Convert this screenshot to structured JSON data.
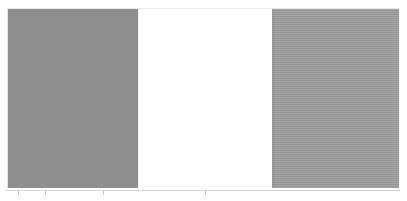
{
  "panel": {
    "name": "tri-band-color-panel",
    "background_color": "#ffffff",
    "bands": [
      {
        "id": "left",
        "label": "",
        "fill": "#8e8e8e",
        "pattern": "solid",
        "x": 7,
        "width": 130
      },
      {
        "id": "center",
        "label": "",
        "fill": "#ffffff",
        "pattern": "solid",
        "x": 137,
        "width": 135
      },
      {
        "id": "right",
        "label": "",
        "fill": "#9b9b9b",
        "pattern": "horizontal-scanlines",
        "x": 272,
        "width": 127
      }
    ]
  },
  "axis": {
    "rule_color": "#d6d6d6",
    "ticks": [
      {
        "x": 12,
        "label": ""
      },
      {
        "x": 39,
        "label": ""
      },
      {
        "x": 97,
        "label": ""
      },
      {
        "x": 199,
        "label": ""
      }
    ]
  },
  "chart_data": {
    "type": "bar",
    "title": "",
    "xlabel": "",
    "ylabel": "",
    "categories": [
      "1",
      "2",
      "3"
    ],
    "values": [
      1,
      1,
      1
    ],
    "colors": [
      "#8e8e8e",
      "#ffffff",
      "#9b9b9b"
    ],
    "grid": false,
    "legend": "none",
    "xlim": [
      0,
      3
    ],
    "ylim": [
      0,
      1
    ]
  }
}
